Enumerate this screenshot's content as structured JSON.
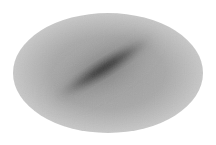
{
  "map": {
    "projection": "all-sky ellipse (Mollweide/Aitoff)",
    "background_color": "#ffffff",
    "ellipse": {
      "cx": 108,
      "cy": 73,
      "rx": 95,
      "ry": 60,
      "edge_color": "#c8c8c8",
      "mid_color": "#a8a8a8"
    },
    "band": {
      "description": "dark diagonal density band from lower-left to upper-right",
      "cx": 104,
      "cy": 68,
      "length": 110,
      "width": 16,
      "angle_deg": -32,
      "core_color": "#101010",
      "halo_color": "#606060"
    },
    "labels": []
  }
}
